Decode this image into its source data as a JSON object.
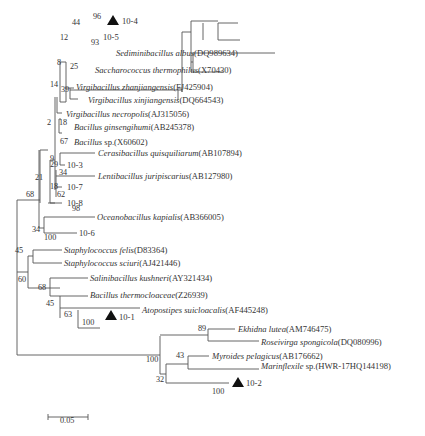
{
  "figure": {
    "type": "phylogenetic-tree",
    "scale_bar": {
      "label": "0.05"
    },
    "marker_symbol": "▲",
    "taxa": [
      {
        "id": "t1",
        "name": "10-4",
        "accession": "",
        "marked": true,
        "italic": false
      },
      {
        "id": "t2",
        "name": "10-5",
        "accession": "",
        "marked": false,
        "italic": false
      },
      {
        "id": "t3",
        "name": "Sediminibacillus albus",
        "accession": "(DQ989634)",
        "italic": true
      },
      {
        "id": "t4",
        "name": "Saccharococcus thermophilus",
        "accession": "(X70430)",
        "italic": true
      },
      {
        "id": "t5",
        "name": "Virgibacillus zhanjiangensis",
        "accession": "(FJ425904)",
        "italic": true
      },
      {
        "id": "t6",
        "name": "Virgibacillus xinjiangensis",
        "accession": "(DQ664543)",
        "italic": true
      },
      {
        "id": "t7",
        "name": "Virgibacillus necropolis",
        "accession": "(AJ315056)",
        "italic": true
      },
      {
        "id": "t8",
        "name": "Bacillus ginsengihumi",
        "accession": "(AB245378)",
        "italic": true
      },
      {
        "id": "t9",
        "name": "Bacillus",
        "accession": " sp.(X60602)",
        "italic": true
      },
      {
        "id": "t10",
        "name": "Cerasibacillus quisquiliarum",
        "accession": "(AB107894)",
        "italic": true
      },
      {
        "id": "t11",
        "name": "10-3",
        "accession": "",
        "italic": false
      },
      {
        "id": "t12",
        "name": "Lentibacillus juripiscarius",
        "accession": "(AB127980)",
        "italic": true
      },
      {
        "id": "t13",
        "name": "10-7",
        "accession": "",
        "italic": false
      },
      {
        "id": "t14",
        "name": "10-8",
        "accession": "",
        "italic": false
      },
      {
        "id": "t15",
        "name": "Oceanobacillus kapialis",
        "accession": "(AB366005)",
        "italic": true
      },
      {
        "id": "t16",
        "name": "10-6",
        "accession": "",
        "italic": false
      },
      {
        "id": "t17",
        "name": "Staphylococcus felis",
        "accession": "(D83364)",
        "italic": true
      },
      {
        "id": "t18",
        "name": "Staphylococcus sciuri",
        "accession": "(AJ421446)",
        "italic": true
      },
      {
        "id": "t19",
        "name": "Salinibacillus kushneri",
        "accession": "(AY321434)",
        "italic": true
      },
      {
        "id": "t20",
        "name": "Bacillus thermocloaceae",
        "accession": "(Z26939)",
        "italic": true
      },
      {
        "id": "t21",
        "name": "Atopostipes suicloacalis",
        "accession": "(AF445248)",
        "italic": true
      },
      {
        "id": "t22",
        "name": "10-1",
        "accession": "",
        "marked": true,
        "italic": false
      },
      {
        "id": "t23",
        "name": "Ekhidna lutea",
        "accession": "(AM746475)",
        "italic": true
      },
      {
        "id": "t24",
        "name": "Roseivirga spongicola",
        "accession": "(DQ080996)",
        "italic": true
      },
      {
        "id": "t25",
        "name": "Myroides pelagicus",
        "accession": "(AB176662)",
        "italic": true
      },
      {
        "id": "t26",
        "name": "Marinflexile",
        "accession": " sp.(HWR-17HQ144198)",
        "italic": true
      },
      {
        "id": "t27",
        "name": "10-2",
        "accession": "",
        "marked": true,
        "italic": false
      }
    ],
    "bootstrap_values": [
      "96",
      "44",
      "93",
      "12",
      "25",
      "8",
      "14",
      "39",
      "2",
      "18",
      "67",
      "9",
      "29",
      "34",
      "21",
      "18",
      "62",
      "68",
      "98",
      "34",
      "100",
      "45",
      "60",
      "68",
      "45",
      "63",
      "100",
      "89",
      "100",
      "43",
      "32",
      "100"
    ]
  }
}
